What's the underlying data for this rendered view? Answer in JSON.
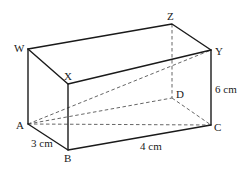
{
  "figure": {
    "type": "cuboid",
    "vertices": {
      "W": {
        "label": "W"
      },
      "X": {
        "label": "X"
      },
      "Y": {
        "label": "Y"
      },
      "Z": {
        "label": "Z"
      },
      "A": {
        "label": "A"
      },
      "B": {
        "label": "B"
      },
      "C": {
        "label": "C"
      },
      "D": {
        "label": "D"
      }
    },
    "dimensions": {
      "AB": "3 cm",
      "BC": "4 cm",
      "CY": "6 cm"
    },
    "hidden_edges": [
      "ZD",
      "AD",
      "DC"
    ],
    "diagonals": [
      "AC",
      "AY"
    ]
  }
}
